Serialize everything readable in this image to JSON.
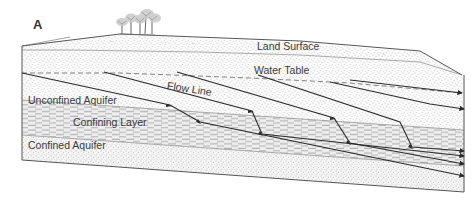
{
  "figure": {
    "panel_letter": "A",
    "labels": {
      "land_surface": "Land Surface",
      "water_table": "Water Table",
      "flow_line": "Flow Line",
      "unconfined_aquifer": "Unconfined Aquifer",
      "confining_layer": "Confining Layer",
      "confined_aquifer": "Confined Aquifer"
    },
    "surface_marks": [
      "ᵥᵥ",
      "ᵥ",
      "ᵥᵥ",
      "ᵥ",
      "ᵥ",
      "ᵥ"
    ],
    "colors": {
      "outline": "#555555",
      "flow_line": "#2b2b2b",
      "stipple": "#8a8a8a",
      "confining_dash": "#9a9a9a",
      "confining_bg": "#ececec",
      "text": "#3a3a3a"
    }
  }
}
